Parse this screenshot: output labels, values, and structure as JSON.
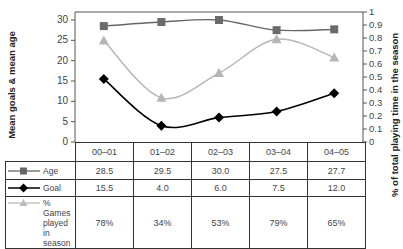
{
  "chart_data": {
    "type": "line",
    "title": "",
    "categories": [
      "00–01",
      "01–02",
      "02–03",
      "03–04",
      "04–05"
    ],
    "series": [
      {
        "name": "Age",
        "axis": "left",
        "values": [
          28.5,
          29.5,
          30.0,
          27.5,
          27.7
        ],
        "display": [
          "28.5",
          "29.5",
          "30.0",
          "27.5",
          "27.7"
        ],
        "color": "#666666",
        "marker": "square"
      },
      {
        "name": "Goal",
        "axis": "left",
        "values": [
          15.5,
          4.0,
          6.0,
          7.5,
          12.0
        ],
        "display": [
          "15.5",
          "4.0",
          "6.0",
          "7.5",
          "12.0"
        ],
        "color": "#000000",
        "marker": "diamond"
      },
      {
        "name": "% Games played in season",
        "axis": "right",
        "values": [
          0.78,
          0.34,
          0.53,
          0.79,
          0.65
        ],
        "display": [
          "78%",
          "34%",
          "53%",
          "79%",
          "65%"
        ],
        "color": "#aaaaaa",
        "marker": "triangle"
      }
    ],
    "ylabel": "Mean goals & mean age",
    "ylabel_right": "% of total playing time in the season",
    "ylim": [
      0,
      30
    ],
    "ylim_right": [
      0,
      1
    ],
    "yticks": [
      "0",
      "5",
      "10",
      "15",
      "20",
      "25",
      "30"
    ],
    "yticks_right": [
      "0",
      "0.1",
      "0.2",
      "0.3",
      "0.4",
      "0.5",
      "0.6",
      "0.7",
      "0.8",
      "0.9",
      "1"
    ],
    "grid": false,
    "legend_position": "data-table-left"
  },
  "table": {
    "legend_labels": [
      "Age",
      "Goal",
      "% Games played in season"
    ],
    "legend_lines": [
      [
        "Age"
      ],
      [
        "Goal"
      ],
      [
        "% Games",
        "played in",
        "season"
      ]
    ]
  }
}
